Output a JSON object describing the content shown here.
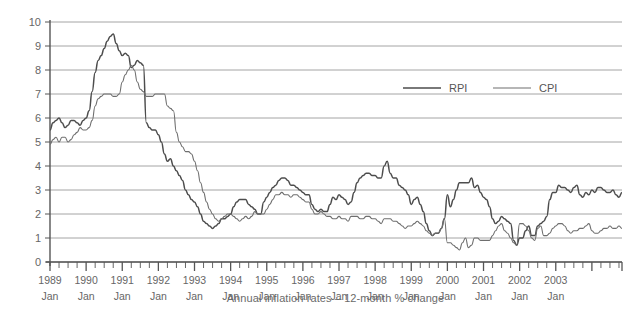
{
  "caption": "Annual inflation rates – 12-month % change",
  "legend": {
    "items": [
      {
        "label": "RPI",
        "color": "#4d4d4d"
      },
      {
        "label": "CPI",
        "color": "#6e6e6e"
      }
    ]
  },
  "axis": {
    "y_ticks": [
      "0",
      "1",
      "2",
      "3",
      "4",
      "5",
      "6",
      "7",
      "8",
      "9",
      "10"
    ],
    "x_ticks": [
      {
        "year": "1989",
        "month": "Jan"
      },
      {
        "year": "1990",
        "month": "Jan"
      },
      {
        "year": "1991",
        "month": "Jan"
      },
      {
        "year": "1992",
        "month": "Jan"
      },
      {
        "year": "1993",
        "month": "Jan"
      },
      {
        "year": "1994",
        "month": "Jan"
      },
      {
        "year": "1995",
        "month": "Jan"
      },
      {
        "year": "1996",
        "month": "Jan"
      },
      {
        "year": "1997",
        "month": "Jan"
      },
      {
        "year": "1998",
        "month": "Jan"
      },
      {
        "year": "1999",
        "month": "Jan"
      },
      {
        "year": "2000",
        "month": "Jan"
      },
      {
        "year": "2001",
        "month": "Jan"
      },
      {
        "year": "2002",
        "month": "Jan"
      },
      {
        "year": "2003",
        "month": "Jan"
      }
    ]
  },
  "chart_data": {
    "type": "line",
    "title": "Annual inflation rates – 12-month % change",
    "xlabel": "",
    "ylabel": "",
    "ylim": [
      0,
      10
    ],
    "ytick_step": 1,
    "grid": true,
    "legend_position": "top-right-inside",
    "x_start": "1989-01",
    "x_end": "2003-11",
    "x_frequency": "monthly",
    "series": [
      {
        "name": "RPI",
        "color": "#4d4d4d",
        "values": [
          5.5,
          5.8,
          5.9,
          6.0,
          5.8,
          5.6,
          5.7,
          5.9,
          5.9,
          5.8,
          5.7,
          5.9,
          6.0,
          6.3,
          7.1,
          7.9,
          8.4,
          8.6,
          8.9,
          9.2,
          9.4,
          9.5,
          9.1,
          8.8,
          8.6,
          8.7,
          8.6,
          8.1,
          8.2,
          8.4,
          8.3,
          8.2,
          5.8,
          5.6,
          5.5,
          5.5,
          5.3,
          5.0,
          4.5,
          4.2,
          4.3,
          4.0,
          3.8,
          3.6,
          3.4,
          3.0,
          2.8,
          2.6,
          2.5,
          2.3,
          2.0,
          1.7,
          1.6,
          1.5,
          1.4,
          1.5,
          1.6,
          1.8,
          1.8,
          1.9,
          2.0,
          2.3,
          2.5,
          2.6,
          2.6,
          2.6,
          2.4,
          2.3,
          2.2,
          2.0,
          2.0,
          2.5,
          2.7,
          2.9,
          3.1,
          3.2,
          3.4,
          3.5,
          3.5,
          3.4,
          3.2,
          3.2,
          3.1,
          3.0,
          2.9,
          2.8,
          2.8,
          2.4,
          2.2,
          2.1,
          2.2,
          2.1,
          2.1,
          2.4,
          2.7,
          2.6,
          2.8,
          2.7,
          2.6,
          2.4,
          2.5,
          2.9,
          3.3,
          3.5,
          3.6,
          3.7,
          3.7,
          3.6,
          3.6,
          3.5,
          3.5,
          4.0,
          4.2,
          3.7,
          3.5,
          3.5,
          3.2,
          3.1,
          3.0,
          2.8,
          2.4,
          2.6,
          2.7,
          2.4,
          2.1,
          1.6,
          1.3,
          1.1,
          1.2,
          1.2,
          1.4,
          1.8,
          2.8,
          2.3,
          2.6,
          3.0,
          3.3,
          3.3,
          3.3,
          3.3,
          3.5,
          3.1,
          3.2,
          2.9,
          2.7,
          2.6,
          2.3,
          1.8,
          1.6,
          1.7,
          1.9,
          1.8,
          1.7,
          1.6,
          0.9,
          0.7,
          1.0,
          1.0,
          1.3,
          1.5,
          1.1,
          1.1,
          1.5,
          1.6,
          1.7,
          1.9,
          2.6,
          2.9,
          2.9,
          3.2,
          3.1,
          3.1,
          3.0,
          2.9,
          3.1,
          3.2,
          2.8,
          2.7,
          2.9,
          2.8,
          3.0,
          2.9,
          3.1,
          3.1,
          3.0,
          2.9,
          2.9,
          3.0,
          2.8,
          2.7,
          2.9
        ]
      },
      {
        "name": "CPI",
        "color": "#6e6e6e",
        "values": [
          4.9,
          5.1,
          5.2,
          5.0,
          5.2,
          5.2,
          5.0,
          5.1,
          5.3,
          5.4,
          5.6,
          5.5,
          5.5,
          5.6,
          5.9,
          6.5,
          6.8,
          6.9,
          7.0,
          7.0,
          7.0,
          6.9,
          6.9,
          7.0,
          7.5,
          7.8,
          8.0,
          8.2,
          8.0,
          7.5,
          7.2,
          7.1,
          6.9,
          6.9,
          6.9,
          7.0,
          7.0,
          7.0,
          7.0,
          6.5,
          6.4,
          6.3,
          5.4,
          5.0,
          4.8,
          4.6,
          4.6,
          4.5,
          4.2,
          3.8,
          3.3,
          2.9,
          2.5,
          2.2,
          2.0,
          1.8,
          1.7,
          1.8,
          1.9,
          2.0,
          2.0,
          1.9,
          1.8,
          1.7,
          1.8,
          1.9,
          1.8,
          1.9,
          2.1,
          2.0,
          2.0,
          2.0,
          2.2,
          2.4,
          2.6,
          2.8,
          2.8,
          2.9,
          2.8,
          2.8,
          2.7,
          2.8,
          2.8,
          2.7,
          2.6,
          2.5,
          2.5,
          2.2,
          2.0,
          2.0,
          2.1,
          2.0,
          1.9,
          1.9,
          1.8,
          1.8,
          1.9,
          1.8,
          1.8,
          1.7,
          1.9,
          1.9,
          1.9,
          1.8,
          1.8,
          1.9,
          1.9,
          1.8,
          1.8,
          1.7,
          1.6,
          1.8,
          1.8,
          1.8,
          1.7,
          1.7,
          1.6,
          1.5,
          1.4,
          1.5,
          1.5,
          1.6,
          1.7,
          1.6,
          1.5,
          1.3,
          1.2,
          1.1,
          1.2,
          1.2,
          1.4,
          1.8,
          0.8,
          0.8,
          0.7,
          0.6,
          0.5,
          0.8,
          1.0,
          0.6,
          0.7,
          1.0,
          1.0,
          0.9,
          0.9,
          0.9,
          0.9,
          1.1,
          1.3,
          1.5,
          1.6,
          1.3,
          1.2,
          1.0,
          0.8,
          0.7,
          1.6,
          1.6,
          1.5,
          1.3,
          1.0,
          0.9,
          1.4,
          1.5,
          1.1,
          1.1,
          1.2,
          1.4,
          1.5,
          1.6,
          1.6,
          1.5,
          1.3,
          1.2,
          1.3,
          1.3,
          1.4,
          1.4,
          1.5,
          1.6,
          1.3,
          1.2,
          1.2,
          1.3,
          1.4,
          1.4,
          1.5,
          1.4,
          1.4,
          1.5,
          1.4
        ]
      }
    ]
  },
  "style": {
    "grid_color": "#9a9a9a",
    "axis_color": "#555555",
    "text_color": "#666666",
    "background": "#ffffff"
  }
}
